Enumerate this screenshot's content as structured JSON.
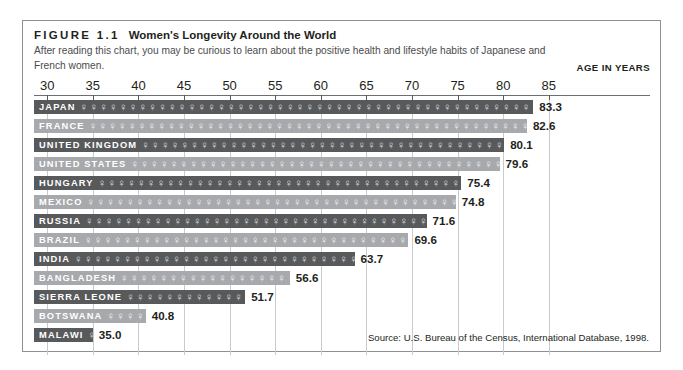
{
  "figure": {
    "label": "FIGURE 1.1",
    "title": "Women's Longevity Around the World",
    "subtitle": "After reading this chart, you may be curious to learn about the positive health and lifestyle habits of Japanese and French women.",
    "axis_title": "AGE IN YEARS",
    "source": "Source: U.S. Bureau of the Census, International Database, 1998."
  },
  "symbol": {
    "glyph": "♀",
    "name": "venus-female-symbol"
  },
  "colors": {
    "bar_dark": "#58595b",
    "bar_light": "#a7a9ac",
    "border": "#8e9092",
    "gridline": "#c9cacc",
    "text": "#231f20"
  },
  "chart_data": {
    "type": "bar",
    "orientation": "horizontal",
    "title": "Women's Longevity Around the World",
    "xlabel": "AGE IN YEARS",
    "ylabel": "",
    "xlim": [
      28,
      85
    ],
    "xticks": [
      30,
      35,
      40,
      45,
      50,
      55,
      60,
      65,
      70,
      75,
      80,
      85
    ],
    "grid": true,
    "legend": "none",
    "categories": [
      "JAPAN",
      "FRANCE",
      "UNITED KINGDOM",
      "UNITED STATES",
      "HUNGARY",
      "MEXICO",
      "RUSSIA",
      "BRAZIL",
      "INDIA",
      "BANGLADESH",
      "SIERRA LEONE",
      "BOTSWANA",
      "MALAWI"
    ],
    "values": [
      83.3,
      82.6,
      80.1,
      79.6,
      75.4,
      74.8,
      71.6,
      69.6,
      63.7,
      56.6,
      51.7,
      40.8,
      35.0
    ],
    "value_labels": [
      "83.3",
      "82.6",
      "80.1",
      "79.6",
      "75.4",
      "74.8",
      "71.6",
      "69.6",
      "63.7",
      "56.6",
      "51.7",
      "40.8",
      "35.0"
    ],
    "annotation": "Source: U.S. Bureau of the Census, International Database, 1998."
  }
}
